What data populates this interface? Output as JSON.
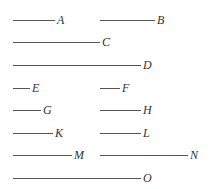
{
  "diagram": {
    "type": "line-segment-comparison",
    "line_color": "#555555",
    "label_color": "#333333",
    "segments": [
      {
        "label": "A",
        "x1": 13,
        "x2": 55,
        "y": 20
      },
      {
        "label": "B",
        "x1": 100,
        "x2": 155,
        "y": 20
      },
      {
        "label": "C",
        "x1": 13,
        "x2": 100,
        "y": 42
      },
      {
        "label": "D",
        "x1": 13,
        "x2": 141,
        "y": 65
      },
      {
        "label": "E",
        "x1": 13,
        "x2": 30,
        "y": 88
      },
      {
        "label": "F",
        "x1": 100,
        "x2": 120,
        "y": 88
      },
      {
        "label": "G",
        "x1": 13,
        "x2": 41,
        "y": 110
      },
      {
        "label": "H",
        "x1": 100,
        "x2": 141,
        "y": 110
      },
      {
        "label": "K",
        "x1": 13,
        "x2": 53,
        "y": 133
      },
      {
        "label": "L",
        "x1": 100,
        "x2": 141,
        "y": 133
      },
      {
        "label": "M",
        "x1": 13,
        "x2": 72,
        "y": 155
      },
      {
        "label": "N",
        "x1": 100,
        "x2": 188,
        "y": 155
      },
      {
        "label": "O",
        "x1": 13,
        "x2": 141,
        "y": 178
      }
    ]
  }
}
